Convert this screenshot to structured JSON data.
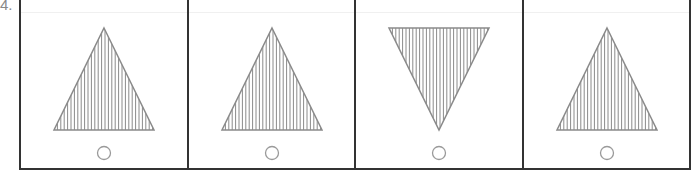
{
  "question": {
    "number": "4."
  },
  "options": [
    {
      "shape": "triangle-up",
      "fill": "vertical-hatch",
      "marker": "circle"
    },
    {
      "shape": "triangle-up",
      "fill": "vertical-hatch",
      "marker": "circle"
    },
    {
      "shape": "triangle-down",
      "fill": "vertical-hatch",
      "marker": "circle"
    },
    {
      "shape": "triangle-up",
      "fill": "vertical-hatch",
      "marker": "circle"
    }
  ],
  "colors": {
    "shape_stroke": "#8a8a8a",
    "frame": "#333333",
    "circle": "#9a9a9a"
  }
}
